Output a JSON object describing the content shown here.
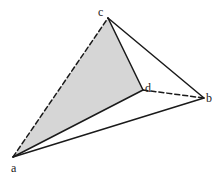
{
  "diagram": {
    "type": "tetrahedron",
    "colors": {
      "stroke": "#1a1a1a",
      "shaded_face": "#d6d6d6",
      "background": "#ffffff"
    },
    "vertices": [
      {
        "id": "a",
        "label": "a",
        "x": 13,
        "y": 157,
        "lx": 11,
        "ly": 172
      },
      {
        "id": "b",
        "label": "b",
        "x": 204,
        "y": 98,
        "lx": 206,
        "ly": 102
      },
      {
        "id": "c",
        "label": "c",
        "x": 108,
        "y": 18,
        "lx": 98,
        "ly": 16
      },
      {
        "id": "d",
        "label": "d",
        "x": 143,
        "y": 90,
        "lx": 145,
        "ly": 92
      }
    ],
    "shaded_face": [
      "a",
      "c",
      "d"
    ],
    "edges": [
      {
        "from": "a",
        "to": "c",
        "style": "dashed"
      },
      {
        "from": "c",
        "to": "d",
        "style": "solid"
      },
      {
        "from": "a",
        "to": "d",
        "style": "solid"
      },
      {
        "from": "c",
        "to": "b",
        "style": "solid"
      },
      {
        "from": "a",
        "to": "b",
        "style": "solid"
      },
      {
        "from": "d",
        "to": "b",
        "style": "dashed"
      }
    ]
  }
}
